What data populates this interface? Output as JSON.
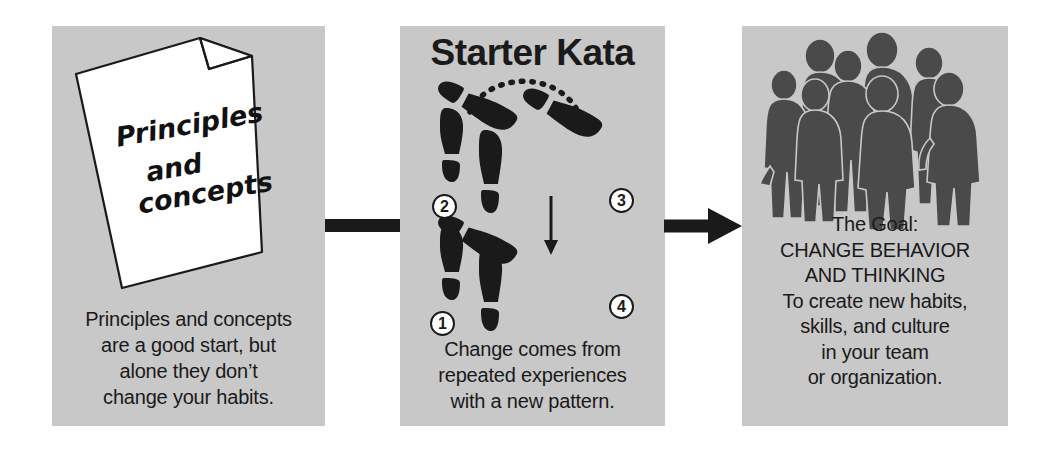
{
  "diagram": {
    "panels": [
      {
        "id": "principles",
        "paper_lines": [
          "Principles",
          "and",
          "concepts"
        ],
        "caption": "Principles and concepts are a good start, but alone they don’t change your habits."
      },
      {
        "id": "starter-kata",
        "title": "Starter Kata",
        "step_numbers": [
          "1",
          "2",
          "3",
          "4"
        ],
        "caption": "Change comes from repeated experiences with a new pattern."
      },
      {
        "id": "goal",
        "caption": "The Goal: CHANGE BEHAVIOR AND THINKING To create new habits, skills, and culture in your team or organization."
      }
    ],
    "captions": {
      "left": [
        "Principles and concepts",
        "are a good start, but",
        "alone they don’t",
        "change your habits."
      ],
      "mid": [
        "Change comes from",
        "repeated experiences",
        "with a new pattern."
      ],
      "right": [
        "The Goal:",
        "CHANGE BEHAVIOR",
        "AND THINKING",
        "To create new habits,",
        "skills, and culture",
        "in your team",
        "or organization."
      ]
    },
    "colors": {
      "panel_background": "#c8c8c8",
      "ink": "#1a1a1a",
      "paper": "#ffffff",
      "silhouette": "#4a4a4a"
    }
  }
}
